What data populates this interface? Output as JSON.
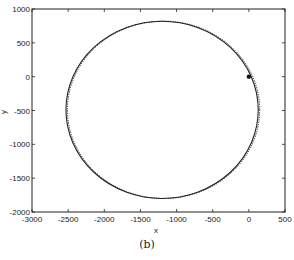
{
  "chart_data": {
    "type": "line",
    "title": "",
    "caption": "(b)",
    "xlabel": "x",
    "ylabel": "y",
    "xlim": [
      -3000,
      500
    ],
    "ylim": [
      -2000,
      1000
    ],
    "xticks": [
      "-3000",
      "-2500",
      "-2000",
      "-1500",
      "-1000",
      "-500",
      "0",
      "500"
    ],
    "yticks": [
      "1000",
      "500",
      "0",
      "-500",
      "-1000",
      "-1500",
      "-2000"
    ],
    "grid": false,
    "series": [
      {
        "name": "trajectory-solid",
        "shape": "closed-loop",
        "center": [
          -1200,
          -490
        ],
        "radius_x": 1330,
        "radius_y": 1310,
        "style": "solid"
      },
      {
        "name": "trajectory-dotted",
        "shape": "closed-loop",
        "center": [
          -1180,
          -490
        ],
        "radius_x": 1330,
        "radius_y": 1310,
        "style": "dotted"
      }
    ],
    "markers": [
      {
        "x": 0,
        "y": 0,
        "label": "start point"
      }
    ]
  }
}
